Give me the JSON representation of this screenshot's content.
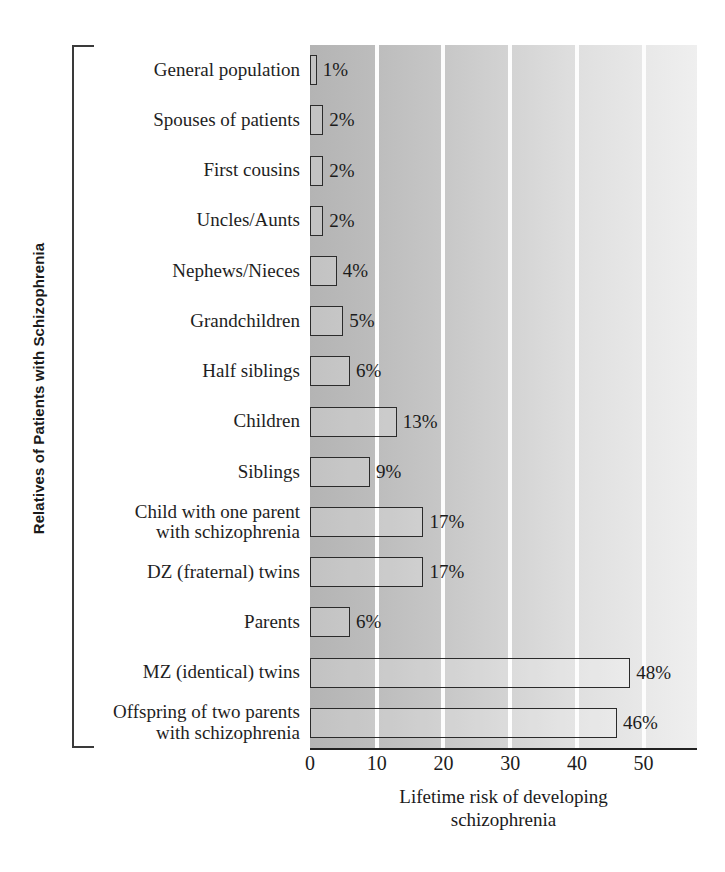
{
  "chart_data": {
    "type": "bar",
    "orientation": "horizontal",
    "title": "",
    "xlabel": "Lifetime risk of developing schizophrenia",
    "ylabel": "Relatives of Patients with Schizophrenia",
    "xlim": [
      0,
      58
    ],
    "ylim": null,
    "grid": true,
    "legend": null,
    "xticks": [
      "0",
      "10",
      "20",
      "30",
      "40",
      "50"
    ],
    "xtick_values": [
      0,
      10,
      20,
      30,
      40,
      50
    ],
    "categories": [
      "General population",
      "Spouses of patients",
      "First cousins",
      "Uncles/Aunts",
      "Nephews/Nieces",
      "Grandchildren",
      "Half siblings",
      "Children",
      "Siblings",
      "Child with one parent with schizophrenia",
      "DZ (fraternal) twins",
      "Parents",
      "MZ (identical) twins",
      "Offspring of two parents with schizophrenia"
    ],
    "category_lines": [
      [
        "General population"
      ],
      [
        "Spouses of patients"
      ],
      [
        "First cousins"
      ],
      [
        "Uncles/Aunts"
      ],
      [
        "Nephews/Nieces"
      ],
      [
        "Grandchildren"
      ],
      [
        "Half siblings"
      ],
      [
        "Children"
      ],
      [
        "Siblings"
      ],
      [
        "Child with one parent",
        "with schizophrenia"
      ],
      [
        "DZ (fraternal) twins"
      ],
      [
        "Parents"
      ],
      [
        "MZ (identical) twins"
      ],
      [
        "Offspring of two parents",
        "with schizophrenia"
      ]
    ],
    "values": [
      1,
      2,
      2,
      2,
      4,
      5,
      6,
      13,
      9,
      17,
      17,
      6,
      48,
      46
    ],
    "value_labels": [
      "1%",
      "2%",
      "2%",
      "2%",
      "4%",
      "5%",
      "6%",
      "13%",
      "9%",
      "17%",
      "17%",
      "6%",
      "48%",
      "46%"
    ],
    "colors": {
      "bar_fill": "#c8c8c8",
      "bar_edge": "#2b2b2b",
      "plot_bg_left": "#b4b4b4",
      "plot_bg_right": "#efefef",
      "gridline": "#fdfdfd",
      "axis": "#222222",
      "text": "#1b1b1b"
    }
  },
  "axes": {
    "x_title_lines": [
      "Lifetime risk of developing",
      "schizophrenia"
    ],
    "y_title": "Relatives of Patients with Schizophrenia"
  }
}
